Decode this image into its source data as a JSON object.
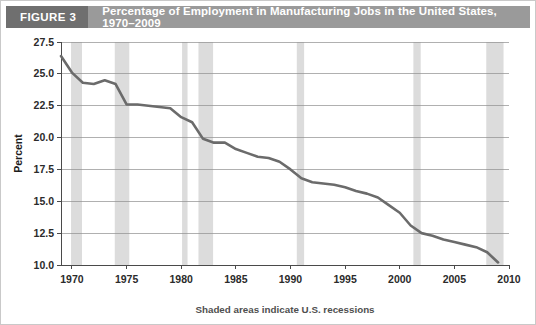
{
  "figure": {
    "tag": "FIGURE 3",
    "title": "Percentage of Employment in Manufacturing Jobs in the United States, 1970–2009"
  },
  "colors": {
    "header_bar": "#9a9a9a",
    "header_tag": "#6f6f6f",
    "line": "#6b6b6b",
    "recession_band": "#dcdcdc",
    "grid": "#8f8f8f",
    "frame_border": "#c9c9c9"
  },
  "chart_data": {
    "type": "line",
    "title": "Percentage of Employment in Manufacturing Jobs in the United States, 1970–2009",
    "xlabel": "",
    "ylabel": "Percent",
    "xlim": [
      1969,
      2010
    ],
    "ylim": [
      10.0,
      27.5
    ],
    "grid": true,
    "legend": false,
    "annotation": "Shaded areas indicate U.S. recessions",
    "y_ticks": [
      "10.0",
      "12.5",
      "15.0",
      "17.5",
      "20.0",
      "22.5",
      "25.0",
      "27.5"
    ],
    "y_tick_values": [
      10.0,
      12.5,
      15.0,
      17.5,
      20.0,
      22.5,
      25.0,
      27.5
    ],
    "x_ticks": [
      "1970",
      "1975",
      "1980",
      "1985",
      "1990",
      "1995",
      "2000",
      "2005",
      "2010"
    ],
    "x_tick_values": [
      1970,
      1975,
      1980,
      1985,
      1990,
      1995,
      2000,
      2005,
      2010
    ],
    "series": [
      {
        "name": "Manufacturing share of employment",
        "x": [
          1969,
          1970,
          1971,
          1972,
          1973,
          1974,
          1975,
          1976,
          1977,
          1978,
          1979,
          1980,
          1981,
          1982,
          1983,
          1984,
          1985,
          1986,
          1987,
          1988,
          1989,
          1990,
          1991,
          1992,
          1993,
          1994,
          1995,
          1996,
          1997,
          1998,
          1999,
          2000,
          2001,
          2002,
          2003,
          2004,
          2005,
          2006,
          2007,
          2008,
          2009
        ],
        "values": [
          26.4,
          25.1,
          24.3,
          24.2,
          24.5,
          24.2,
          22.6,
          22.6,
          22.5,
          22.4,
          22.3,
          21.6,
          21.2,
          19.9,
          19.6,
          19.6,
          19.1,
          18.8,
          18.5,
          18.4,
          18.1,
          17.5,
          16.8,
          16.5,
          16.4,
          16.3,
          16.1,
          15.8,
          15.6,
          15.3,
          14.7,
          14.1,
          13.1,
          12.5,
          12.3,
          12.0,
          11.8,
          11.6,
          11.4,
          11.0,
          10.2
        ]
      }
    ],
    "recessions": [
      {
        "label": "1969–1970",
        "start": 1969.92,
        "end": 1970.92
      },
      {
        "label": "1973–1975",
        "start": 1973.92,
        "end": 1975.25
      },
      {
        "label": "1980",
        "start": 1980.08,
        "end": 1980.58
      },
      {
        "label": "1981–1982",
        "start": 1981.58,
        "end": 1982.92
      },
      {
        "label": "1990–1991",
        "start": 1990.58,
        "end": 1991.25
      },
      {
        "label": "2001",
        "start": 2001.25,
        "end": 2001.92
      },
      {
        "label": "2007–2009",
        "start": 2007.92,
        "end": 2009.5
      }
    ]
  }
}
